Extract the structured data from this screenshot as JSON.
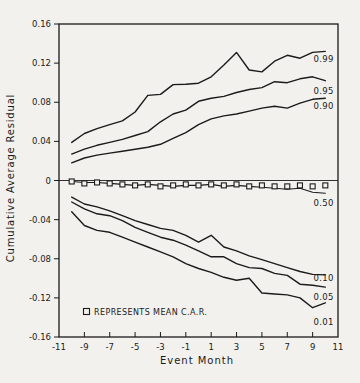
{
  "figure": {
    "background": "#f2f1ed",
    "line_color": "#1b1b1b"
  },
  "chart_data": {
    "type": "line",
    "title": "",
    "xlabel": "Event Month",
    "ylabel": "Cumulative Average Residual",
    "xlim": [
      -11,
      11
    ],
    "ylim": [
      -0.16,
      0.16
    ],
    "grid": false,
    "zero_line": true,
    "legend_position": "bottom-left-inside",
    "x_ticks": [
      -11,
      -9,
      -7,
      -5,
      -3,
      -1,
      1,
      3,
      5,
      7,
      9,
      11
    ],
    "x_tick_labels": [
      "-11",
      "-9",
      "-7",
      "-5",
      "-3",
      "-1",
      "1",
      "3",
      "5",
      "7",
      "9",
      "11"
    ],
    "y_ticks": [
      0.16,
      0.12,
      0.08,
      0.04,
      0,
      -0.04,
      -0.08,
      -0.12,
      -0.16
    ],
    "y_tick_labels": [
      "0.16",
      "0.12",
      "0.08",
      "0.04",
      "0",
      "-0.04",
      "-0.08",
      "-0.12",
      "-0.16"
    ],
    "x": [
      -10,
      -9,
      -8,
      -7,
      -6,
      -5,
      -4,
      -3,
      -2,
      -1,
      0,
      1,
      2,
      3,
      4,
      5,
      6,
      7,
      8,
      9,
      10
    ],
    "series": [
      {
        "name": "0.99",
        "label_value": 0.124,
        "values": [
          0.039,
          0.048,
          0.053,
          0.057,
          0.061,
          0.07,
          0.087,
          0.088,
          0.098,
          0.0985,
          0.0995,
          0.106,
          0.118,
          0.131,
          0.113,
          0.111,
          0.122,
          0.128,
          0.125,
          0.131,
          0.132
        ]
      },
      {
        "name": "0.95",
        "label_value": 0.092,
        "values": [
          0.027,
          0.032,
          0.036,
          0.039,
          0.042,
          0.046,
          0.05,
          0.06,
          0.068,
          0.072,
          0.081,
          0.084,
          0.086,
          0.09,
          0.093,
          0.095,
          0.101,
          0.1,
          0.104,
          0.106,
          0.102
        ]
      },
      {
        "name": "0.90",
        "label_value": 0.0765,
        "values": [
          0.018,
          0.023,
          0.026,
          0.028,
          0.03,
          0.032,
          0.034,
          0.037,
          0.043,
          0.049,
          0.057,
          0.063,
          0.066,
          0.068,
          0.071,
          0.074,
          0.076,
          0.074,
          0.079,
          0.083,
          0.084
        ]
      },
      {
        "name": "0.50",
        "label_value": -0.0235,
        "thin": true,
        "values": [
          -0.001,
          -0.002,
          -0.002,
          -0.003,
          -0.004,
          -0.005,
          -0.004,
          -0.005,
          -0.006,
          -0.005,
          -0.005,
          -0.004,
          -0.006,
          -0.005,
          -0.006,
          -0.007,
          -0.008,
          -0.009,
          -0.008,
          -0.012,
          -0.013
        ]
      },
      {
        "name": "0.10",
        "label_value": -0.1,
        "values": [
          -0.017,
          -0.024,
          -0.027,
          -0.031,
          -0.036,
          -0.041,
          -0.045,
          -0.049,
          -0.051,
          -0.056,
          -0.063,
          -0.056,
          -0.068,
          -0.072,
          -0.077,
          -0.081,
          -0.085,
          -0.089,
          -0.093,
          -0.096,
          -0.0965
        ]
      },
      {
        "name": "0.05",
        "label_value": -0.119,
        "values": [
          -0.022,
          -0.029,
          -0.034,
          -0.036,
          -0.041,
          -0.048,
          -0.053,
          -0.058,
          -0.061,
          -0.066,
          -0.072,
          -0.078,
          -0.078,
          -0.085,
          -0.089,
          -0.09,
          -0.095,
          -0.097,
          -0.106,
          -0.107,
          -0.109
        ]
      },
      {
        "name": "0.01",
        "label_value": -0.1445,
        "values": [
          -0.032,
          -0.046,
          -0.051,
          -0.053,
          -0.058,
          -0.063,
          -0.068,
          -0.073,
          -0.078,
          -0.085,
          -0.09,
          -0.094,
          -0.099,
          -0.102,
          -0.1,
          -0.115,
          -0.116,
          -0.117,
          -0.12,
          -0.13,
          -0.125
        ]
      }
    ],
    "markers": {
      "name": "mean_car",
      "symbol": "open-square",
      "values": [
        -0.001,
        -0.003,
        -0.002,
        -0.003,
        -0.004,
        -0.005,
        -0.004,
        -0.006,
        -0.005,
        -0.004,
        -0.005,
        -0.004,
        -0.005,
        -0.004,
        -0.006,
        -0.005,
        -0.006,
        -0.006,
        -0.005,
        -0.006,
        -0.005
      ]
    },
    "legend": {
      "symbol": "open-square",
      "text": "REPRESENTS MEAN C.A.R."
    }
  }
}
